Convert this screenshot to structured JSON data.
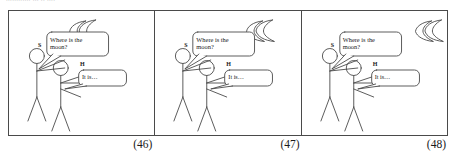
{
  "header": {
    "clipped_text": "............ ... .. ...."
  },
  "figure": {
    "panels": [
      {
        "caption": "(46)",
        "moon": {
          "x_pct": 42,
          "y_pct": 12
        },
        "speakers": [
          {
            "tag": "S",
            "line": "Where is the\nmoon?"
          },
          {
            "tag": "H",
            "line": "It is…"
          }
        ]
      },
      {
        "caption": "(47)",
        "moon": {
          "x_pct": 64,
          "y_pct": 12
        },
        "speakers": [
          {
            "tag": "S",
            "line": "Where is the\nmoon?"
          },
          {
            "tag": "H",
            "line": "It is…"
          }
        ]
      },
      {
        "caption": "(48)",
        "moon": {
          "x_pct": 84,
          "y_pct": 12
        },
        "speakers": [
          {
            "tag": "S",
            "line": "Where is the\nmoon?"
          },
          {
            "tag": "H",
            "line": "It is…"
          }
        ]
      }
    ]
  },
  "colors": {
    "ink": "#4a4a4a",
    "text": "#1a1a1a",
    "background": "#ffffff",
    "faint": "#c9c9c9"
  }
}
